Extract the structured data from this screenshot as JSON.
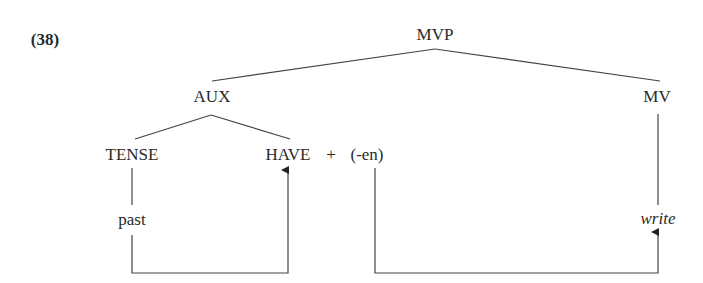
{
  "example_number": "(38)",
  "nodes": {
    "root": "MVP",
    "aux": "AUX",
    "mv": "MV",
    "tense": "TENSE",
    "have": "HAVE",
    "plus": "+",
    "en": "(-en)",
    "past": "past",
    "write": "write"
  },
  "colors": {
    "ink": "#2a2a2a",
    "line": "#444444",
    "background": "#ffffff"
  }
}
